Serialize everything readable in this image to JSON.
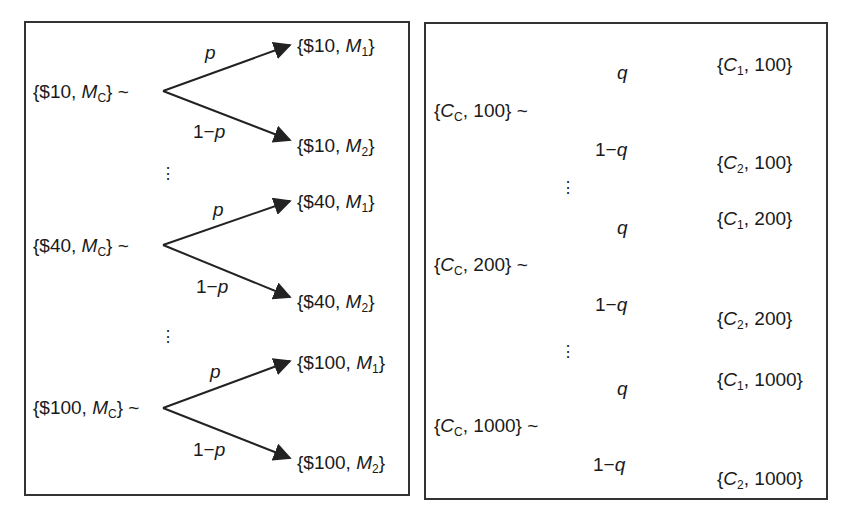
{
  "left_panel": {
    "branch_prob_up": "p",
    "branch_prob_down_prefix": "1−",
    "branch_prob_down_var": "p",
    "trees": [
      {
        "root_amount": "{$10, ",
        "root_var": "M",
        "root_sub": "C",
        "root_suffix": "} ~",
        "up_amount": "{$10, ",
        "up_var": "M",
        "up_sub": "1",
        "up_suffix": "}",
        "down_amount": "{$10, ",
        "down_var": "M",
        "down_sub": "2",
        "down_suffix": "}"
      },
      {
        "root_amount": "{$40, ",
        "root_var": "M",
        "root_sub": "C",
        "root_suffix": "} ~",
        "up_amount": "{$40, ",
        "up_var": "M",
        "up_sub": "1",
        "up_suffix": "}",
        "down_amount": "{$40, ",
        "down_var": "M",
        "down_sub": "2",
        "down_suffix": "}"
      },
      {
        "root_amount": "{$100, ",
        "root_var": "M",
        "root_sub": "C",
        "root_suffix": "} ~",
        "up_amount": "{$100, ",
        "up_var": "M",
        "up_sub": "1",
        "up_suffix": "}",
        "down_amount": "{$100, ",
        "down_var": "M",
        "down_sub": "2",
        "down_suffix": "}"
      }
    ],
    "ellipsis": "⋮"
  },
  "right_panel": {
    "branch_prob_up": "q",
    "branch_prob_down_prefix": "1−",
    "branch_prob_down_var": "q",
    "trees": [
      {
        "root_open": "{",
        "root_var": "C",
        "root_sub": "C",
        "root_rest": ", 100} ~",
        "up_open": "{",
        "up_var": "C",
        "up_sub": "1",
        "up_rest": ", 100}",
        "down_open": "{",
        "down_var": "C",
        "down_sub": "2",
        "down_rest": ", 100}"
      },
      {
        "root_open": "{",
        "root_var": "C",
        "root_sub": "C",
        "root_rest": ", 200} ~",
        "up_open": "{",
        "up_var": "C",
        "up_sub": "1",
        "up_rest": ", 200}",
        "down_open": "{",
        "down_var": "C",
        "down_sub": "2",
        "down_rest": ", 200}"
      },
      {
        "root_open": "{",
        "root_var": "C",
        "root_sub": "C",
        "root_rest": ", 1000} ~",
        "up_open": "{",
        "up_var": "C",
        "up_sub": "1",
        "up_rest": ", 1000}",
        "down_open": "{",
        "down_var": "C",
        "down_sub": "2",
        "down_rest": ", 1000}"
      }
    ],
    "ellipsis": "⋮"
  }
}
